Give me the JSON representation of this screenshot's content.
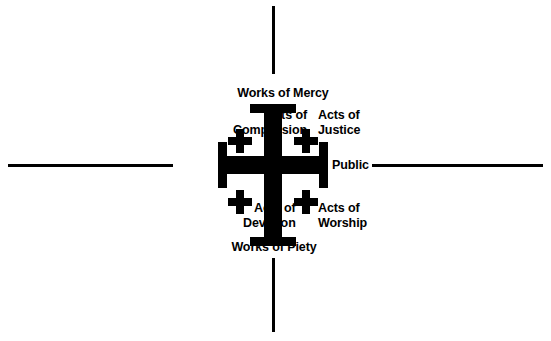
{
  "diagram": {
    "type": "quadrant-diagram",
    "center_symbol": "jerusalem-cross",
    "colors": {
      "ink": "#000000",
      "background": "#ffffff"
    },
    "axes": {
      "vertical": {
        "top_label": "Works of Mercy",
        "bottom_label": "Works of Piety"
      },
      "horizontal": {
        "left_label": "Private",
        "right_label": "Public"
      }
    },
    "quadrants": [
      {
        "position": "top-left",
        "line1": "Acts of",
        "line2": "Compassion",
        "text": "Acts of\nCompassion"
      },
      {
        "position": "top-right",
        "line1": "Acts of",
        "line2": "Justice",
        "text": "Acts of\nJustice"
      },
      {
        "position": "bottom-left",
        "line1": "Acts of",
        "line2": "Devotion",
        "text": "Acts of\nDevotion"
      },
      {
        "position": "bottom-right",
        "line1": "Acts of",
        "line2": "Worship",
        "text": "Acts of\nWorship"
      }
    ],
    "labels": {
      "works_of_mercy": "Works of Mercy",
      "works_of_piety": "Works of Piety",
      "private": "Private",
      "public": "Public",
      "acts_of_compassion": "Acts of\nCompassion",
      "acts_of_justice": "Acts of\nJustice",
      "acts_of_devotion": "Acts of\nDevotion",
      "acts_of_worship": "Acts of\nWorship"
    }
  }
}
